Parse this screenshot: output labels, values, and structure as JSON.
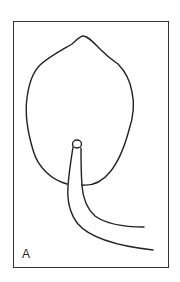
{
  "figure": {
    "panel_label": "A",
    "line_color": "#222222",
    "frame_color": "#333333",
    "background": "#ffffff"
  }
}
